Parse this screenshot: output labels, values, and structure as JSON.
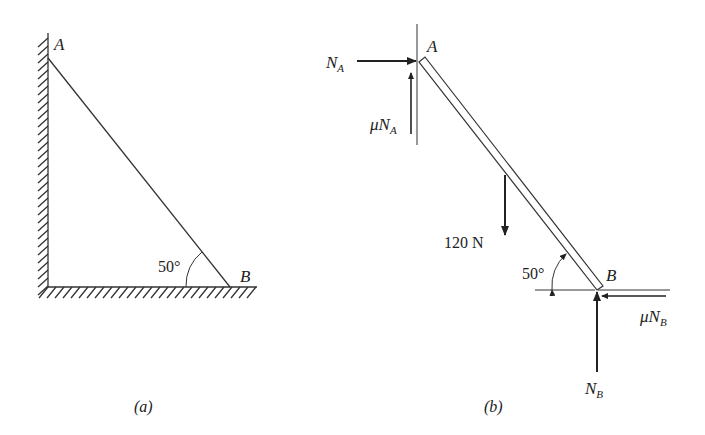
{
  "figure_a": {
    "caption": "(a)",
    "point_a": "A",
    "point_b": "B",
    "angle": "50°"
  },
  "figure_b": {
    "caption": "(b)",
    "point_a": "A",
    "point_b": "B",
    "angle": "50°",
    "force_na_sym": "N",
    "force_na_sub": "A",
    "force_mu_na_mu": "μN",
    "force_mu_na_sub": "A",
    "weight": "120 N",
    "force_nb_sym": "N",
    "force_nb_sub": "B",
    "force_mu_nb_mu": "μN",
    "force_mu_nb_sub": "B"
  }
}
